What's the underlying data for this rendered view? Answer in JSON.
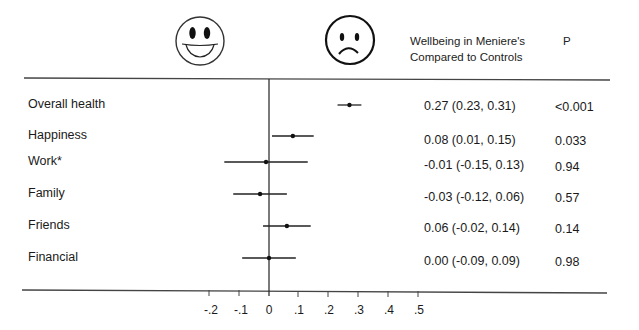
{
  "header": {
    "favorable_icon": "smiley-face-icon",
    "unfavorable_icon": "sad-face-icon",
    "estimate_title_line1": "Wellbeing in Meniere's",
    "estimate_title_line2": "Compared to Controls",
    "p_title": "P"
  },
  "rows": [
    {
      "label": "Overall health",
      "estimate_text": "0.27 (0.23, 0.31)",
      "p": "<0.001"
    },
    {
      "label": "Happiness",
      "estimate_text": "0.08 (0.01, 0.15)",
      "p": "0.033"
    },
    {
      "label": "Work*",
      "estimate_text": "-0.01 (-0.15, 0.13)",
      "p": "0.94"
    },
    {
      "label": "Family",
      "estimate_text": "-0.03 (-0.12, 0.06)",
      "p": "0.57"
    },
    {
      "label": "Friends",
      "estimate_text": "0.06 (-0.02, 0.14)",
      "p": "0.14"
    },
    {
      "label": "Financial",
      "estimate_text": "0.00 (-0.09, 0.09)",
      "p": "0.98"
    }
  ],
  "axis": {
    "ticks": [
      "-.2",
      "-.1",
      "0",
      ".1",
      ".2",
      ".3",
      ".4",
      ".5"
    ]
  },
  "chart_data": {
    "type": "scatter",
    "subtype": "forest_plot",
    "title": "Wellbeing in Meniere's Compared to Controls",
    "xlabel": "",
    "ylabel": "",
    "categories": [
      "Overall health",
      "Happiness",
      "Work*",
      "Family",
      "Friends",
      "Financial"
    ],
    "estimates": [
      0.27,
      0.08,
      -0.01,
      -0.03,
      0.06,
      0.0
    ],
    "ci_lower": [
      0.23,
      0.01,
      -0.15,
      -0.12,
      -0.02,
      -0.09
    ],
    "ci_upper": [
      0.31,
      0.15,
      0.13,
      0.06,
      0.14,
      0.09
    ],
    "p_values": [
      "<0.001",
      "0.033",
      "0.94",
      "0.57",
      "0.14",
      "0.98"
    ],
    "xlim": [
      -0.2,
      0.5
    ],
    "xticks": [
      -0.2,
      -0.1,
      0,
      0.1,
      0.2,
      0.3,
      0.4,
      0.5
    ],
    "reference_line": 0,
    "grid": false,
    "annotations": [
      "smiley face (left of zero)",
      "sad face (right of zero)"
    ]
  }
}
